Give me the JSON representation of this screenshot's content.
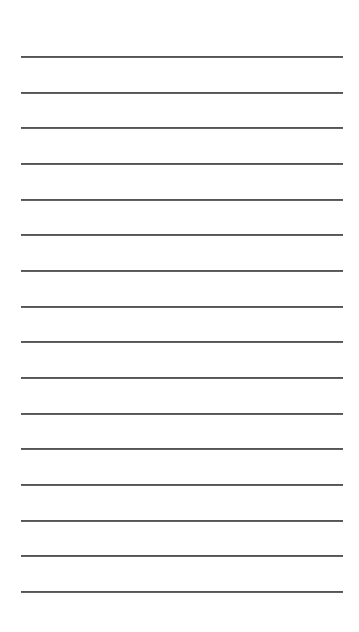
{
  "page": {
    "background": "#ffffff",
    "line_color": "#555555",
    "line_count": 16,
    "line_left": 21,
    "line_width": 322,
    "first_line_y": 56,
    "line_spacing": 35.67
  }
}
